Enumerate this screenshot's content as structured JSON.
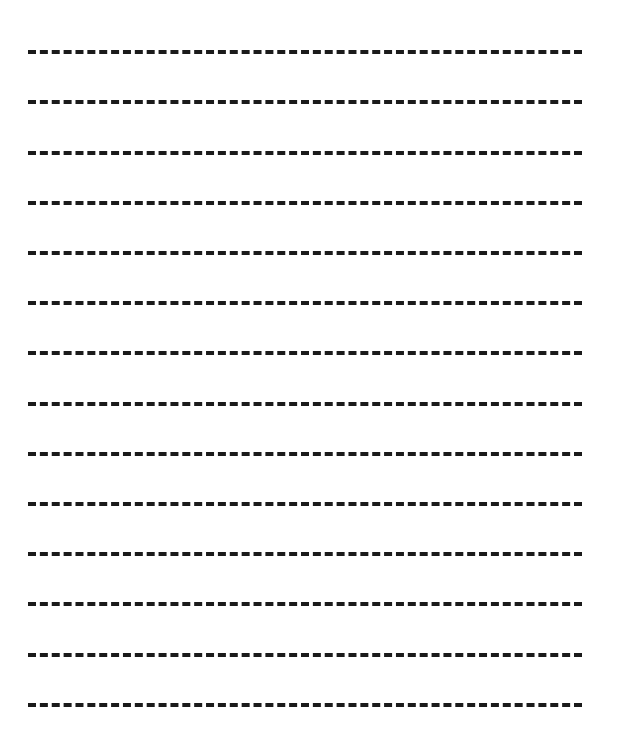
{
  "document": {
    "type": "worksheet",
    "title": "Dashed Guide Line Practice Sheet",
    "description": "Blank handwriting practice page consisting of evenly spaced horizontal dashed guide rules on a plain white background. No text, headings, numbers, labels or other marks are present.",
    "canvas": {
      "width_px": 617,
      "height_px": 753,
      "background_color": "#ffffff"
    },
    "page_text": "",
    "labels": [],
    "headings": [],
    "annotations": []
  },
  "rules": {
    "count": 14,
    "line_color": "#1a1a1a",
    "line_thickness_px": 4,
    "dash_length_px": 13,
    "dash_gap_px": 8,
    "dash_period_px": 21,
    "dashes_per_line": 27,
    "left_x_px": 28,
    "right_x_px": 582,
    "line_width_px": 554,
    "first_line_y_px": 52,
    "last_line_y_px": 705,
    "line_spacing_px": 50.2,
    "lines": [
      {
        "index": 1,
        "y_px": 52,
        "label": "guide-rule-1"
      },
      {
        "index": 2,
        "y_px": 102,
        "label": "guide-rule-2"
      },
      {
        "index": 3,
        "y_px": 153,
        "label": "guide-rule-3"
      },
      {
        "index": 4,
        "y_px": 203,
        "label": "guide-rule-4"
      },
      {
        "index": 5,
        "y_px": 253,
        "label": "guide-rule-5"
      },
      {
        "index": 6,
        "y_px": 303,
        "label": "guide-rule-6"
      },
      {
        "index": 7,
        "y_px": 353,
        "label": "guide-rule-7"
      },
      {
        "index": 8,
        "y_px": 404,
        "label": "guide-rule-8"
      },
      {
        "index": 9,
        "y_px": 454,
        "label": "guide-rule-9"
      },
      {
        "index": 10,
        "y_px": 504,
        "label": "guide-rule-10"
      },
      {
        "index": 11,
        "y_px": 554,
        "label": "guide-rule-11"
      },
      {
        "index": 12,
        "y_px": 604,
        "label": "guide-rule-12"
      },
      {
        "index": 13,
        "y_px": 655,
        "label": "guide-rule-13"
      },
      {
        "index": 14,
        "y_px": 705,
        "label": "guide-rule-14"
      }
    ]
  }
}
